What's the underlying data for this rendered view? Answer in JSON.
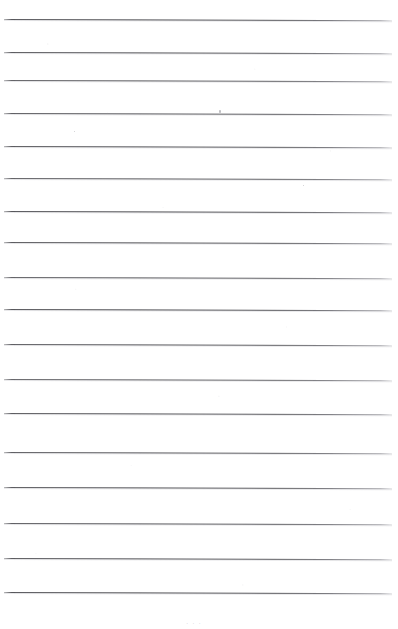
{
  "document": {
    "kind": "scanned-ruled-page",
    "title": "",
    "body_text": "",
    "page_number": "",
    "bottom_mark_text": "· · ·"
  },
  "canvas": {
    "width": 398,
    "height": 629,
    "background_color": "#fefefe",
    "paper_tone": "#ffffff"
  },
  "ruling": {
    "line_color": "#3e3e43",
    "line_color_faded": "#aaaab0",
    "line_count": 17,
    "line_thickness_px": 1,
    "first_line_y": 19,
    "spacing_px": 35.8,
    "left_margin_x": 4,
    "right_margin_x": 392,
    "skew_degrees": 0.18,
    "lines": [
      {
        "index": 1,
        "y": 19,
        "x_start": 4,
        "x_end": 392,
        "thickness": 1.2,
        "opacity": 0.95
      },
      {
        "index": 2,
        "y": 52,
        "x_start": 4,
        "x_end": 392,
        "thickness": 1.1,
        "opacity": 0.92
      },
      {
        "index": 3,
        "y": 80,
        "x_start": 4,
        "x_end": 392,
        "thickness": 1.0,
        "opacity": 0.88
      },
      {
        "index": 4,
        "y": 113,
        "x_start": 4,
        "x_end": 392,
        "thickness": 1.1,
        "opacity": 0.9
      },
      {
        "index": 5,
        "y": 146,
        "x_start": 4,
        "x_end": 392,
        "thickness": 1.1,
        "opacity": 0.92
      },
      {
        "index": 6,
        "y": 178,
        "x_start": 4,
        "x_end": 392,
        "thickness": 1.0,
        "opacity": 0.88
      },
      {
        "index": 7,
        "y": 211,
        "x_start": 4,
        "x_end": 392,
        "thickness": 1.2,
        "opacity": 0.95
      },
      {
        "index": 8,
        "y": 242,
        "x_start": 4,
        "x_end": 392,
        "thickness": 1.1,
        "opacity": 0.92
      },
      {
        "index": 9,
        "y": 277,
        "x_start": 4,
        "x_end": 392,
        "thickness": 1.0,
        "opacity": 0.88
      },
      {
        "index": 10,
        "y": 309,
        "x_start": 4,
        "x_end": 392,
        "thickness": 1.2,
        "opacity": 0.95
      },
      {
        "index": 11,
        "y": 344,
        "x_start": 4,
        "x_end": 392,
        "thickness": 1.1,
        "opacity": 0.9
      },
      {
        "index": 12,
        "y": 379,
        "x_start": 4,
        "x_end": 392,
        "thickness": 1.0,
        "opacity": 0.86
      },
      {
        "index": 13,
        "y": 413,
        "x_start": 4,
        "x_end": 392,
        "thickness": 1.1,
        "opacity": 0.92
      },
      {
        "index": 14,
        "y": 452,
        "x_start": 4,
        "x_end": 392,
        "thickness": 1.1,
        "opacity": 0.9
      },
      {
        "index": 15,
        "y": 487,
        "x_start": 4,
        "x_end": 392,
        "thickness": 1.1,
        "opacity": 0.92
      },
      {
        "index": 16,
        "y": 523,
        "x_start": 4,
        "x_end": 392,
        "thickness": 1.1,
        "opacity": 0.9
      },
      {
        "index": 17,
        "y": 558,
        "x_start": 4,
        "x_end": 392,
        "thickness": 1.1,
        "opacity": 0.92
      },
      {
        "index": 18,
        "y": 592,
        "x_start": 4,
        "x_end": 392,
        "thickness": 1.2,
        "opacity": 0.95
      }
    ]
  },
  "artifacts": {
    "specks": [
      {
        "name": "ink-speck-upper",
        "x": 219,
        "y": 110,
        "w": 2,
        "h": 3
      },
      {
        "name": "ink-speck-faint-left",
        "x": 74,
        "y": 131,
        "w": 1,
        "h": 1
      },
      {
        "name": "ink-speck-faint-mid",
        "x": 303,
        "y": 185,
        "w": 1,
        "h": 1
      }
    ],
    "bottom_mark": {
      "x": 186,
      "y": 620
    }
  }
}
